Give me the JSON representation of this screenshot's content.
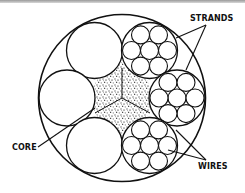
{
  "diagram": {
    "type": "wire-rope-cross-section",
    "labels": {
      "strands": "STRANDS",
      "core": "CORE",
      "wires": "WIRES"
    },
    "components": {
      "outer_rope": "circle",
      "strand_count": 6,
      "strands_shown_with_wires": 3,
      "wires_per_strand": 7,
      "core": "stippled fiber core"
    },
    "colors": {
      "line": "#111111",
      "background": "#ffffff"
    }
  }
}
